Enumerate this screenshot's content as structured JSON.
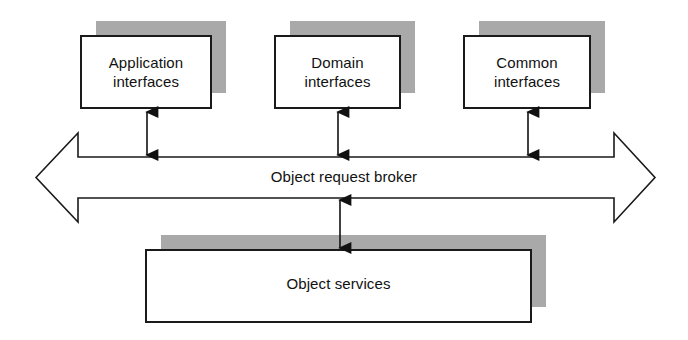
{
  "diagram": {
    "background_color": "#ffffff",
    "stroke_color": "#1a1a1a",
    "shadow_color": "#a9a9a9",
    "box_fill": "#ffffff",
    "text_color": "#111111",
    "top_boxes": [
      {
        "id": "application-interfaces",
        "line1": "Application",
        "line2": "interfaces",
        "x": 81,
        "y": 36,
        "width": 130,
        "height": 72,
        "shadow_dx": 15,
        "shadow_dy": -15
      },
      {
        "id": "domain-interfaces",
        "line1": "Domain",
        "line2": "interfaces",
        "x": 275,
        "y": 36,
        "width": 125,
        "height": 72,
        "shadow_dx": 15,
        "shadow_dy": -15
      },
      {
        "id": "common-interfaces",
        "line1": "Common",
        "line2": "interfaces",
        "x": 464,
        "y": 36,
        "width": 126,
        "height": 72,
        "shadow_dx": 15,
        "shadow_dy": -15
      }
    ],
    "orb": {
      "id": "object-request-broker",
      "label": "Object request broker",
      "shaft_top_y": 157,
      "shaft_bottom_y": 198,
      "head_top_y": 133,
      "head_bottom_y": 222,
      "left_tip_x": 36,
      "left_head_x": 78,
      "right_head_x": 614,
      "right_tip_x": 655
    },
    "bottom_box": {
      "id": "object-services",
      "label": "Object services",
      "x": 146,
      "y": 250,
      "width": 385,
      "height": 72,
      "shadow_dx": 15,
      "shadow_dy": -15
    },
    "connectors": [
      {
        "id": "connector-application-to-orb",
        "x": 147,
        "y_top": 110,
        "y_bottom": 157,
        "heads": "both"
      },
      {
        "id": "connector-domain-to-orb",
        "x": 338,
        "y_top": 110,
        "y_bottom": 157,
        "heads": "both"
      },
      {
        "id": "connector-common-to-orb",
        "x": 528,
        "y_top": 110,
        "y_bottom": 157,
        "heads": "both"
      },
      {
        "id": "connector-orb-to-services",
        "x": 340,
        "y_top": 198,
        "y_bottom": 250,
        "heads": "both"
      }
    ]
  }
}
